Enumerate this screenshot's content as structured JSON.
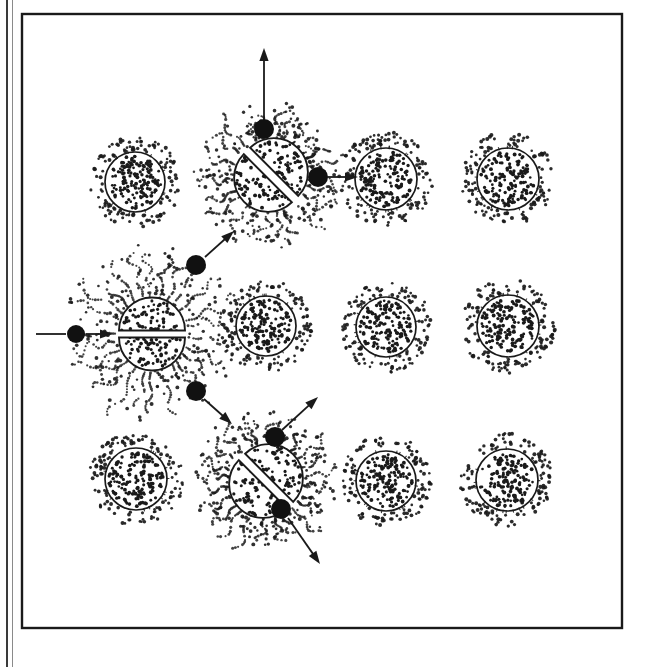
{
  "figure": {
    "caption": "",
    "background_color": "#ffffff",
    "ink_color": "#1a1a1a",
    "width": 648,
    "height": 667
  },
  "frame": {
    "name": "figure-border",
    "outer_rule": {
      "x": 6,
      "y": 0,
      "width": 2,
      "height": 667,
      "color": "#3a3a3a"
    },
    "inner_rect": {
      "x": 22,
      "y": 14,
      "width": 600,
      "height": 614,
      "stroke_width": 2.4,
      "color": "#1a1a1a"
    }
  },
  "legend_hint": {
    "atom_label": "unfissioned atom",
    "fission_label": "fissioning atom",
    "neutron_label": "neutron",
    "arrow_label": "neutron trajectory"
  },
  "atoms": [
    {
      "id": "atom-r1c1",
      "name": "atom-row1-col1",
      "cx": 135,
      "cy": 182,
      "r": 30,
      "halo_r": 44,
      "inner_dots": 150,
      "halo_dots": 120,
      "state": "intact"
    },
    {
      "id": "atom-r1c4",
      "name": "atom-row1-col4",
      "cx": 386,
      "cy": 179,
      "r": 31,
      "halo_r": 45,
      "inner_dots": 150,
      "halo_dots": 120,
      "state": "intact"
    },
    {
      "id": "atom-r1c5",
      "name": "atom-row1-col5",
      "cx": 508,
      "cy": 179,
      "r": 31,
      "halo_r": 45,
      "inner_dots": 150,
      "halo_dots": 120,
      "state": "intact"
    },
    {
      "id": "atom-r2c3",
      "name": "atom-row2-col3",
      "cx": 266,
      "cy": 326,
      "r": 30,
      "halo_r": 44,
      "inner_dots": 150,
      "halo_dots": 120,
      "state": "intact"
    },
    {
      "id": "atom-r2c4",
      "name": "atom-row2-col4",
      "cx": 386,
      "cy": 327,
      "r": 30,
      "halo_r": 44,
      "inner_dots": 150,
      "halo_dots": 120,
      "state": "intact"
    },
    {
      "id": "atom-r2c5",
      "name": "atom-row2-col5",
      "cx": 508,
      "cy": 326,
      "r": 31,
      "halo_r": 45,
      "inner_dots": 150,
      "halo_dots": 120,
      "state": "intact"
    },
    {
      "id": "atom-r3c1",
      "name": "atom-row3-col1",
      "cx": 136,
      "cy": 479,
      "r": 31,
      "halo_r": 45,
      "inner_dots": 150,
      "halo_dots": 120,
      "state": "intact"
    },
    {
      "id": "atom-r3c4",
      "name": "atom-row3-col4",
      "cx": 386,
      "cy": 481,
      "r": 30,
      "halo_r": 44,
      "inner_dots": 150,
      "halo_dots": 120,
      "state": "intact"
    },
    {
      "id": "atom-r3c5",
      "name": "atom-row3-col5",
      "cx": 507,
      "cy": 480,
      "r": 31,
      "halo_r": 45,
      "inner_dots": 150,
      "halo_dots": 120,
      "state": "intact"
    }
  ],
  "fissions": [
    {
      "id": "fission-center-left",
      "name": "fissioning-atom-primary",
      "cx": 152,
      "cy": 334,
      "r": 33,
      "split_angle_deg": 0,
      "gap": 7,
      "burst_r": 88,
      "burst_dots": 300,
      "burst_rays": 26,
      "inner_dots": 120,
      "order": 1
    },
    {
      "id": "fission-top",
      "name": "fissioning-atom-upper",
      "cx": 271,
      "cy": 175,
      "r": 34,
      "split_angle_deg": 45,
      "gap": 9,
      "burst_r": 72,
      "burst_dots": 260,
      "burst_rays": 24,
      "inner_dots": 120,
      "order": 2
    },
    {
      "id": "fission-bottom",
      "name": "fissioning-atom-lower",
      "cx": 266,
      "cy": 481,
      "r": 34,
      "split_angle_deg": 45,
      "gap": 9,
      "burst_r": 72,
      "burst_dots": 260,
      "burst_rays": 24,
      "inner_dots": 120,
      "order": 3
    }
  ],
  "neutrons": [
    {
      "id": "neutron-incoming",
      "name": "neutron-incoming",
      "cx": 76,
      "cy": 334,
      "r": 9
    },
    {
      "id": "neutron-up-left",
      "name": "neutron-to-upper-fission",
      "cx": 196,
      "cy": 265,
      "r": 10
    },
    {
      "id": "neutron-down-left",
      "name": "neutron-to-lower-fission",
      "cx": 196,
      "cy": 391,
      "r": 10
    },
    {
      "id": "neutron-top-vertical",
      "name": "neutron-emitted-up",
      "cx": 264,
      "cy": 129,
      "r": 10
    },
    {
      "id": "neutron-top-right",
      "name": "neutron-emitted-right",
      "cx": 318,
      "cy": 177,
      "r": 10
    },
    {
      "id": "neutron-bottom-upright",
      "name": "neutron-emitted-up-right",
      "cx": 275,
      "cy": 437,
      "r": 10
    },
    {
      "id": "neutron-bottom-downright",
      "name": "neutron-emitted-down-right",
      "cx": 281,
      "cy": 509,
      "r": 10
    }
  ],
  "arrows": [
    {
      "id": "arrow-incoming-tail",
      "name": "arrow-incoming-neutron-tail",
      "x1": 36,
      "y1": 334,
      "x2": 66,
      "y2": 334,
      "head": false,
      "width": 1.8
    },
    {
      "id": "arrow-incoming-head",
      "name": "arrow-incoming-neutron",
      "x1": 86,
      "y1": 334,
      "x2": 113,
      "y2": 334,
      "head": true,
      "width": 1.8
    },
    {
      "id": "arrow-to-upper",
      "name": "arrow-neutron-to-upper-fission",
      "x1": 205,
      "y1": 257,
      "x2": 234,
      "y2": 231,
      "head": true,
      "width": 1.8
    },
    {
      "id": "arrow-to-lower",
      "name": "arrow-neutron-to-lower-fission",
      "x1": 204,
      "y1": 399,
      "x2": 232,
      "y2": 424,
      "head": true,
      "width": 1.8
    },
    {
      "id": "arrow-top-vertical",
      "name": "arrow-neutron-up",
      "x1": 264,
      "y1": 120,
      "x2": 264,
      "y2": 48,
      "head": true,
      "width": 1.8
    },
    {
      "id": "arrow-top-right",
      "name": "arrow-neutron-right",
      "x1": 328,
      "y1": 177,
      "x2": 358,
      "y2": 177,
      "head": true,
      "width": 1.8
    },
    {
      "id": "arrow-bottom-upright",
      "name": "arrow-neutron-up-right",
      "x1": 282,
      "y1": 430,
      "x2": 318,
      "y2": 397,
      "head": true,
      "width": 1.8
    },
    {
      "id": "arrow-bottom-downright",
      "name": "arrow-neutron-down-right",
      "x1": 288,
      "y1": 518,
      "x2": 320,
      "y2": 564,
      "head": true,
      "width": 1.8
    }
  ]
}
